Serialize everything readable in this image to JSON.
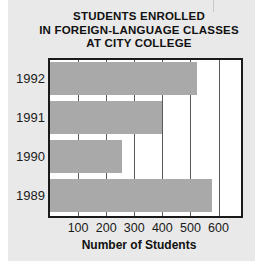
{
  "chart_data": {
    "type": "bar",
    "orientation": "horizontal",
    "title": "STUDENTS ENROLLED IN FOREIGN-LANGUAGE CLASSES AT CITY COLLEGE",
    "title_lines": [
      "STUDENTS ENROLLED",
      "IN FOREIGN-LANGUAGE CLASSES",
      "AT CITY COLLEGE"
    ],
    "categories": [
      "1992",
      "1991",
      "1990",
      "1989"
    ],
    "values": [
      525,
      400,
      255,
      575
    ],
    "xlabel": "Number of Students",
    "ylabel": "",
    "xlim": [
      0,
      680
    ],
    "ylim": [
      0,
      4
    ],
    "xticks": [
      100,
      200,
      300,
      400,
      500,
      600
    ],
    "xtick_labels": [
      "100",
      "200",
      "300",
      "400",
      "500",
      "600"
    ],
    "grid": "vertical",
    "legend": "none",
    "bars": [
      {
        "category": "1992",
        "value": 525
      },
      {
        "category": "1991",
        "value": 400
      },
      {
        "category": "1990",
        "value": 255
      },
      {
        "category": "1989",
        "value": 575
      }
    ],
    "colors": {
      "bar_fill": "#a9a9a9",
      "plot_background": "#ffffff",
      "figure_background": "#e9e9e9",
      "axis": "#1a1a1a",
      "gridline": "#5a5a5a",
      "text": "#111111"
    }
  }
}
